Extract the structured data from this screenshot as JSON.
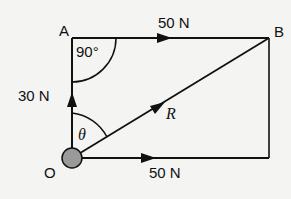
{
  "diagram": {
    "type": "force-parallelogram",
    "points": {
      "O": {
        "label": "O"
      },
      "A": {
        "label": "A"
      },
      "B": {
        "label": "B"
      }
    },
    "forces": [
      {
        "name": "vertical",
        "label": "30 N",
        "from": "O",
        "to": "A"
      },
      {
        "name": "top-horizontal",
        "label": "50 N",
        "from": "A",
        "to": "B"
      },
      {
        "name": "bottom-horizontal",
        "label": "50 N",
        "from": "O",
        "to": "right"
      },
      {
        "name": "resultant",
        "label": "R",
        "from": "O",
        "to": "B"
      }
    ],
    "angles": {
      "right_angle": "90°",
      "theta": "θ"
    },
    "colors": {
      "line": "#111111",
      "background": "#f4f4f2",
      "pivot_fill": "#9a9a9a"
    }
  }
}
